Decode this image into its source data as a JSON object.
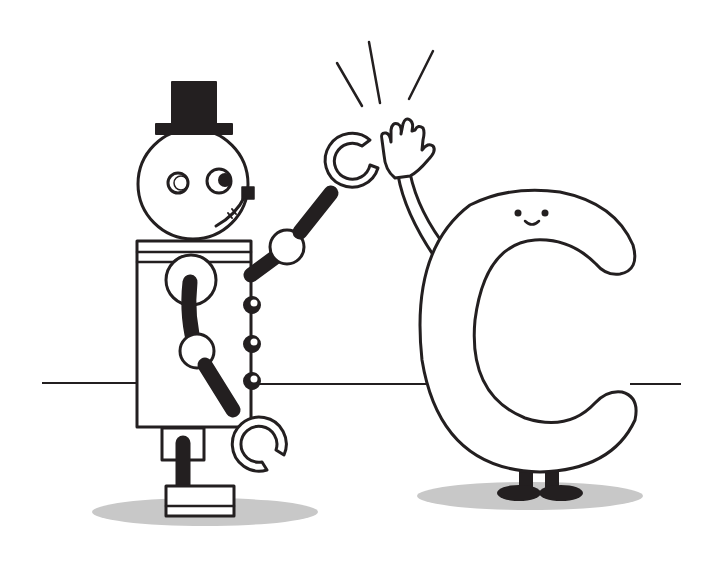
{
  "scene": {
    "description": "Robot giving a high five to a smiling letter C",
    "characters": [
      {
        "id": "robot",
        "label": "Robot with top hat"
      },
      {
        "id": "letter-c",
        "label": "Smiling letter C"
      }
    ]
  },
  "colors": {
    "background": "#ffffff",
    "ink": "#231f20",
    "shadow": "#c8c8c8",
    "fill": "#ffffff"
  }
}
